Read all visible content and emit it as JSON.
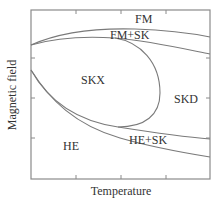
{
  "figure": {
    "type": "phase-diagram",
    "xlabel": "Temperature",
    "ylabel": "Magnetic field",
    "colors": {
      "frame": "#8a8a8a",
      "curve": "#7a7a7a",
      "text": "#333333"
    },
    "regions": [
      {
        "id": "fm",
        "label": "FM"
      },
      {
        "id": "fm-sk",
        "label": "FM+SK"
      },
      {
        "id": "skx",
        "label": "SKX"
      },
      {
        "id": "skd",
        "label": "SKD"
      },
      {
        "id": "he",
        "label": "HE"
      },
      {
        "id": "he-sk",
        "label": "HE+SK"
      }
    ],
    "x_ticks": 3,
    "y_ticks": 3,
    "tick_labels_shown": false
  }
}
